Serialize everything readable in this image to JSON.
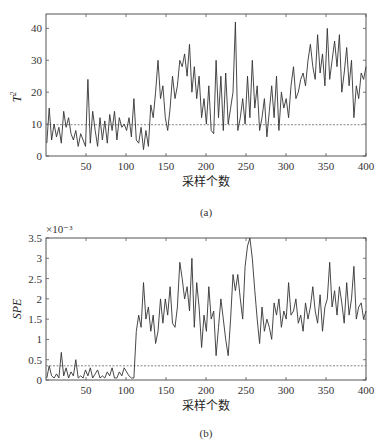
{
  "chart_data": [
    {
      "type": "line",
      "panel_label": "(a)",
      "title": "",
      "xlabel": "采样个数",
      "ylabel": "T²",
      "ylabel_base": "T",
      "ylabel_sup": "2",
      "xlim": [
        0,
        400
      ],
      "ylim": [
        0,
        44.5
      ],
      "xticks": [
        50,
        100,
        150,
        200,
        250,
        300,
        350,
        400
      ],
      "yticks": [
        0,
        10,
        20,
        30,
        40
      ],
      "grid": false,
      "threshold": 9.8,
      "threshold_style": "dashed",
      "x_step": 4,
      "values": [
        4,
        15,
        5,
        10,
        6,
        9,
        4,
        14,
        9,
        12,
        7,
        5,
        8,
        3,
        7,
        5,
        3,
        24,
        4,
        14,
        8,
        3,
        12,
        5,
        11,
        4,
        13,
        8,
        14,
        5,
        12,
        9,
        10,
        8,
        12,
        6,
        18,
        5,
        4,
        9,
        2,
        8,
        3,
        16,
        12,
        20,
        30,
        18,
        22,
        12,
        8,
        15,
        25,
        18,
        22,
        30,
        28,
        32,
        25,
        35,
        20,
        28,
        18,
        25,
        12,
        18,
        10,
        22,
        8,
        7,
        30,
        12,
        25,
        8,
        26,
        10,
        15,
        20,
        42,
        8,
        12,
        18,
        10,
        25,
        12,
        30,
        15,
        22,
        8,
        12,
        18,
        6,
        14,
        22,
        12,
        25,
        8,
        20,
        15,
        18
      ],
      "values_tail": [
        12,
        22,
        28,
        18,
        20,
        24,
        26,
        22,
        30,
        35,
        28,
        24,
        38,
        26,
        32,
        22,
        40,
        24,
        30,
        36,
        28,
        38,
        20,
        26,
        34,
        22,
        30,
        12,
        22,
        18,
        26,
        24,
        28
      ]
    },
    {
      "type": "line",
      "panel_label": "(b)",
      "title": "",
      "xlabel": "采样个数",
      "ylabel": "SPE",
      "y_multiplier": "×10⁻³",
      "xlim": [
        0,
        400
      ],
      "ylim": [
        0,
        3.5
      ],
      "xticks": [
        50,
        100,
        150,
        200,
        250,
        300,
        350,
        400
      ],
      "yticks": [
        0,
        0.5,
        1,
        1.5,
        2,
        2.5,
        3,
        3.5
      ],
      "ytick_labels": [
        "0",
        "0.5",
        "1",
        "1.5",
        "2",
        "2.5",
        "3",
        "3.5"
      ],
      "grid": false,
      "threshold": 0.35,
      "threshold_style": "dashed",
      "x_step": 4,
      "values": [
        0.05,
        0.35,
        0.1,
        0.05,
        0.15,
        0.05,
        0.68,
        0.1,
        0.3,
        0.05,
        0.2,
        0.1,
        0.5,
        0.05,
        0.1,
        0.05,
        0.25,
        0.1,
        0.3,
        0.05,
        0.15,
        0.25,
        0.05,
        0.1,
        0.05,
        0.2,
        0.1,
        0.3,
        0.05,
        0.05,
        0.2,
        0.1,
        0.3,
        0.2,
        0.1,
        0.05,
        0.05,
        1.2,
        1.6,
        1.3,
        2.4,
        1.5,
        1.8,
        1.2,
        1.6,
        0.9,
        1.2,
        2.0,
        1.4,
        2.0,
        1.6,
        2.3,
        1.4,
        1.3,
        1.8,
        2.9,
        2.5,
        2.0,
        2.3,
        1.7,
        3.0,
        1.3,
        2.4,
        1.8,
        0.8,
        1.6,
        1.2,
        2.3,
        1.5,
        1.7,
        0.6,
        1.3,
        2.0,
        1.5,
        1.0,
        0.6,
        1.5,
        2.6,
        2.2,
        2.6,
        2.0,
        1.5,
        2.8,
        3.3,
        3.5,
        3.0,
        2.2,
        1.5,
        0.9,
        1.8,
        1.2,
        1.5,
        1.3,
        1.0,
        1.9,
        1.6,
        2.0,
        1.3,
        1.7,
        1.5
      ],
      "values_tail": [
        2.4,
        1.6,
        1.7,
        2.0,
        1.4,
        1.6,
        1.2,
        1.9,
        1.5,
        1.8,
        2.3,
        1.7,
        1.4,
        2.1,
        1.2,
        1.8,
        2.0,
        2.9,
        1.8,
        2.2,
        1.6,
        2.3,
        1.9,
        1.4,
        2.4,
        1.6,
        2.0,
        2.8,
        1.5,
        1.8,
        1.9,
        1.5,
        1.7
      ]
    }
  ]
}
